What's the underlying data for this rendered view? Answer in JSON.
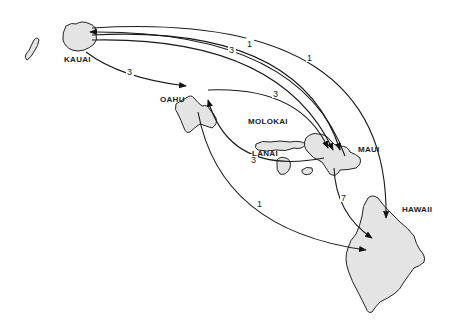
{
  "diagram": {
    "type": "flow-map",
    "islands": [
      {
        "id": "niihau",
        "label": ""
      },
      {
        "id": "kauai",
        "label": "KAUAI"
      },
      {
        "id": "oahu",
        "label": "OAHU"
      },
      {
        "id": "molokai",
        "label": "MOLOKAI"
      },
      {
        "id": "lanai",
        "label": "LANAI"
      },
      {
        "id": "maui",
        "label": "MAUI"
      },
      {
        "id": "hawaii",
        "label": "HAWAII"
      }
    ],
    "routes": [
      {
        "from": "kauai",
        "to": "oahu",
        "value": "3"
      },
      {
        "from": "maui",
        "to": "kauai",
        "value": "1"
      },
      {
        "from": "kauai",
        "to": "maui",
        "value": "3"
      },
      {
        "from": "kauai",
        "to": "maui",
        "value": "1"
      },
      {
        "from": "kauai",
        "to": "hawaii",
        "value": "1"
      },
      {
        "from": "oahu",
        "to": "maui",
        "value": "3"
      },
      {
        "from": "maui",
        "to": "oahu",
        "value": "3"
      },
      {
        "from": "oahu",
        "to": "hawaii",
        "value": "1"
      },
      {
        "from": "maui",
        "to": "hawaii",
        "value": "7"
      }
    ]
  }
}
